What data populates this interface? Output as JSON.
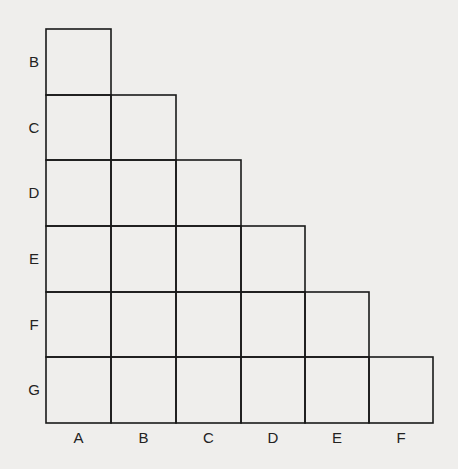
{
  "diagram": {
    "type": "triangular-grid",
    "row_labels": [
      "B",
      "C",
      "D",
      "E",
      "F",
      "G"
    ],
    "column_labels": [
      "A",
      "B",
      "C",
      "D",
      "E",
      "F"
    ],
    "line_color": "#1a1a1a",
    "background": "#efeeec"
  }
}
